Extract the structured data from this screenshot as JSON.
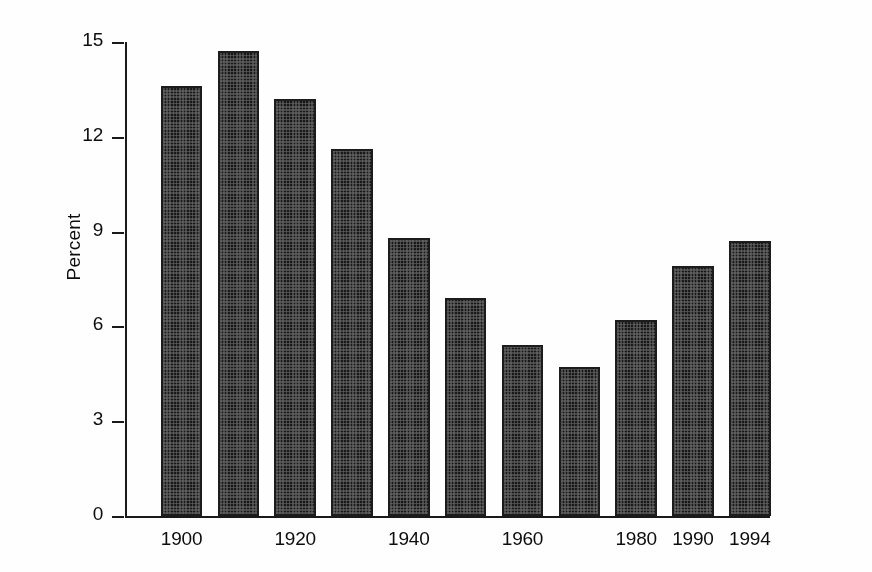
{
  "chart_data": {
    "type": "bar",
    "title": "",
    "subtitle": "",
    "xlabel": "",
    "ylabel": "Percent",
    "categories": [
      "1900",
      "1910",
      "1920",
      "1930",
      "1940",
      "1950",
      "1960",
      "1970",
      "1980",
      "1990",
      "1994"
    ],
    "values": [
      13.6,
      14.7,
      13.2,
      11.6,
      8.8,
      6.9,
      5.4,
      4.7,
      6.2,
      7.9,
      8.7
    ],
    "visible_x_tick_labels": [
      "1900",
      "1920",
      "1940",
      "1960",
      "1980",
      "1990",
      "1994"
    ],
    "visible_x_tick_indices": [
      0,
      2,
      4,
      6,
      8,
      9,
      10
    ],
    "y_tick_labels": [
      "0",
      "3",
      "6",
      "9",
      "12",
      "15"
    ],
    "y_tick_values": [
      0,
      3,
      6,
      9,
      12,
      15
    ],
    "ylim": [
      0,
      15
    ],
    "grid": false,
    "legend": false,
    "legend_position": "none",
    "bar_fill": "#3a3a3a",
    "bar_edge": "#1c1c1c",
    "axis_color": "#1a1a1a",
    "background": "#ffffff"
  }
}
